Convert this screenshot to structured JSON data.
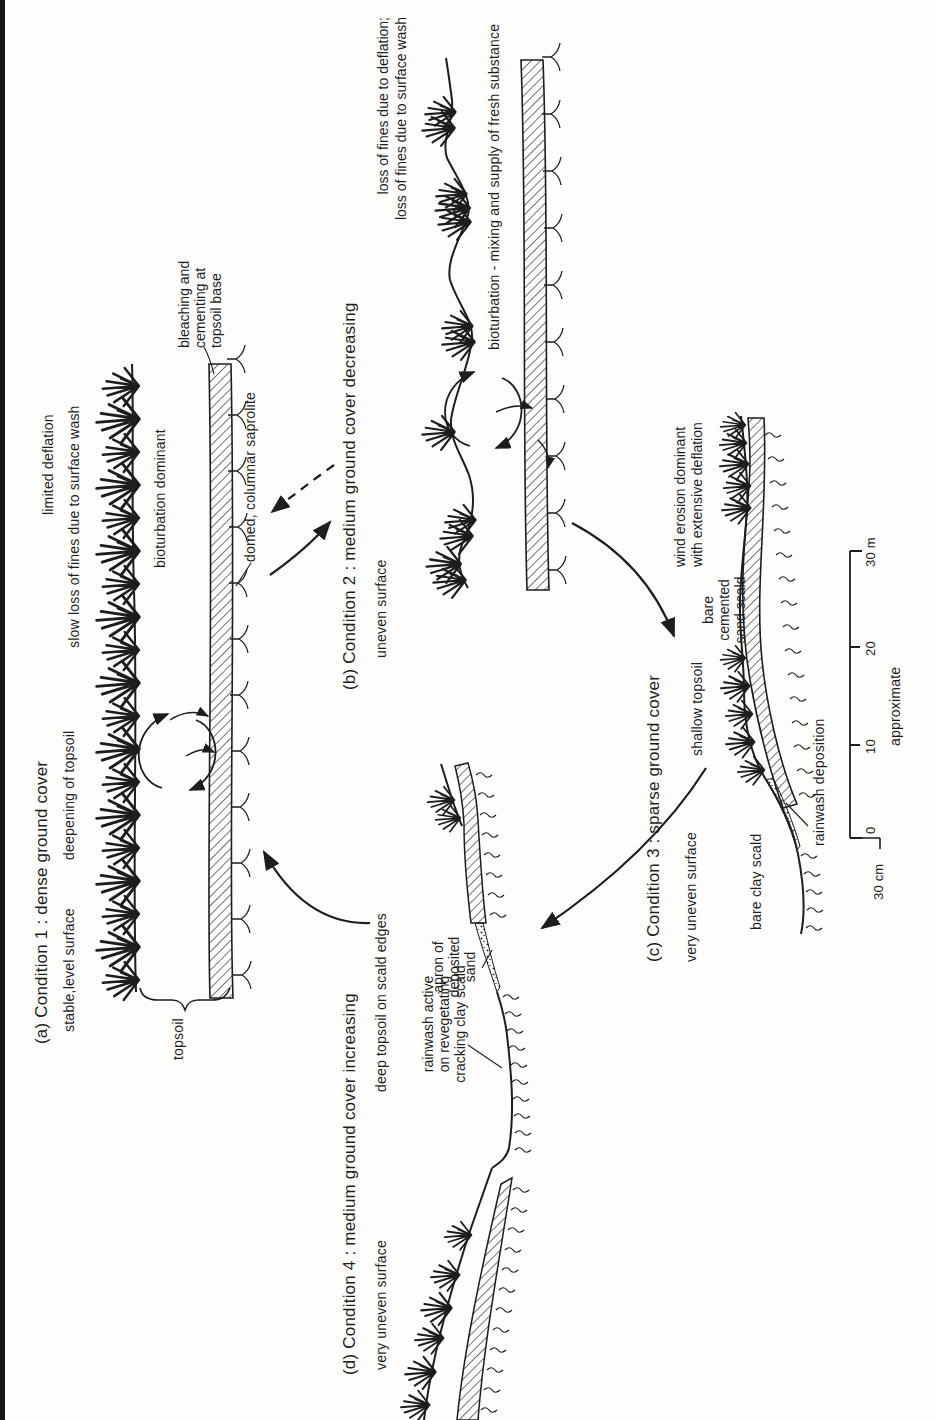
{
  "figure": {
    "paper_color": "#fdfdfc",
    "ink_color": "#1d1d1d",
    "scan_edge_color": "#161616"
  },
  "conditions": {
    "a": {
      "title": "(a) Condition 1 : dense ground cover",
      "subtitle1": "stable,level surface",
      "subtitle2": "deepening of topsoil",
      "notes": {
        "limited_deflation": "limited deflation",
        "slow_loss": "slow loss of fines due to surface wash",
        "bioturbation": "bioturbation dominant",
        "bleaching_l1": "bleaching and",
        "bleaching_l2": "cementing at",
        "bleaching_l3": "topsoil base",
        "domed": "domed, columnar saprolite",
        "topsoil": "topsoil"
      }
    },
    "b": {
      "title": "(b) Condition 2 : medium ground cover decreasing",
      "subtitle": "uneven surface",
      "notes": {
        "loss_l1": "loss of fines due to deflation;",
        "loss_l2": "loss of fines due to surface wash",
        "bioturbation": "bioturbation - mixing and supply of fresh substance"
      }
    },
    "c": {
      "title": "(c) Condition 3 : sparse ground cover",
      "subtitle": "very uneven surface",
      "notes": {
        "wind_l1": "wind erosion dominant",
        "wind_l2": "with extensive deflation",
        "shallow": "shallow topsoil",
        "bare_sand_l1": "bare",
        "bare_sand_l2": "cemented",
        "bare_sand_l3": "sand scald",
        "rainwash": "rainwash deposition",
        "bare_clay": "bare clay scald",
        "a1": "A₁",
        "a2": "A₂",
        "b2": "B₂"
      }
    },
    "d": {
      "title": "(d) Condition 4 : medium ground cover increasing",
      "subtitle": "very uneven surface",
      "notes": {
        "deep_topsoil": "deep topsoil on scald edges",
        "rainwash_l1": "rainwash active",
        "rainwash_l2": "on revegetating",
        "rainwash_l3": "cracking clay scald",
        "apron_l1": "apron of",
        "apron_l2": "deposited",
        "apron_l3": "sand",
        "a1": "A₁",
        "a2": "A₂",
        "b2": "B₂"
      }
    }
  },
  "scale_bar": {
    "tick0": "0",
    "tick10": "10",
    "tick20": "20",
    "tick30": "30 m",
    "approx": "approximate",
    "vertical": "30 cm"
  }
}
